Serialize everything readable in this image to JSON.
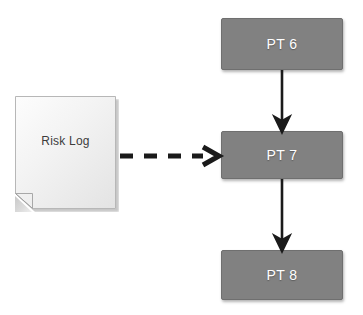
{
  "diagram": {
    "background_color": "#ffffff",
    "nodes": [
      {
        "id": "risk-log",
        "label": "Risk Log",
        "shape": "document",
        "fill_color": "#f2f2f2",
        "text_color": "#3c3c3c",
        "x": 15,
        "y": 96,
        "width": 104,
        "height": 116
      },
      {
        "id": "pt6",
        "label": "PT 6",
        "shape": "rectangle",
        "fill_color": "#818181",
        "text_color": "#ffffff",
        "x": 221,
        "y": 18,
        "width": 122,
        "height": 52
      },
      {
        "id": "pt7",
        "label": "PT 7",
        "shape": "rectangle",
        "fill_color": "#818181",
        "text_color": "#ffffff",
        "x": 221,
        "y": 131,
        "width": 122,
        "height": 48
      },
      {
        "id": "pt8",
        "label": "PT 8",
        "shape": "rectangle",
        "fill_color": "#818181",
        "text_color": "#ffffff",
        "x": 221,
        "y": 250,
        "width": 122,
        "height": 50
      }
    ],
    "edges": [
      {
        "id": "edge-pt6-pt7",
        "from": "pt6",
        "to": "pt7",
        "style": "solid",
        "arrowhead": "filled-triangle",
        "color": "#1a1a1a",
        "label": ""
      },
      {
        "id": "edge-pt7-pt8",
        "from": "pt7",
        "to": "pt8",
        "style": "solid",
        "arrowhead": "filled-triangle",
        "color": "#1a1a1a",
        "label": ""
      },
      {
        "id": "edge-risklog-pt7",
        "from": "risk-log",
        "to": "pt7",
        "style": "dashed",
        "arrowhead": "open-chevron",
        "color": "#1a1a1a",
        "label": ""
      }
    ]
  }
}
